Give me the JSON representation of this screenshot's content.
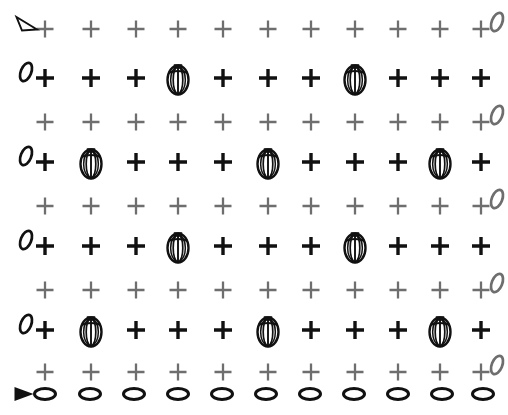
{
  "canvas": {
    "width": 508,
    "height": 415,
    "background": "#ffffff"
  },
  "colors": {
    "black": "#111111",
    "gray": "#6e6e6e"
  },
  "legend": {
    "plus_black_name": "plus-marker-black",
    "plus_gray_name": "plus-marker-gray",
    "melon_name": "melon-lantern-marker",
    "ellipse_name": "flat-ellipse-marker",
    "zero_name": "italic-zero-marker",
    "triangle_hollow_name": "hollow-triangle-marker",
    "triangle_solid_name": "solid-triangle-marker"
  },
  "grid": {
    "columns": 11,
    "rows": 10,
    "col_x": [
      45,
      91,
      136,
      178,
      223,
      268,
      311,
      355,
      398,
      440,
      481
    ],
    "row_y": [
      29,
      78,
      122,
      162,
      206,
      246,
      290,
      330,
      372,
      394
    ],
    "col_x_bottom": [
      45,
      90,
      134,
      178,
      222,
      266,
      310,
      354,
      398,
      442,
      483
    ]
  },
  "rows": [
    {
      "id": "row-1",
      "style": "gray",
      "y": 29,
      "left_marker": "hollow-triangle",
      "right_marker": "zero",
      "cells": [
        "plus",
        "plus",
        "plus",
        "plus",
        "plus",
        "plus",
        "plus",
        "plus",
        "plus",
        "plus",
        "plus"
      ]
    },
    {
      "id": "row-2",
      "style": "black",
      "y": 78,
      "left_marker": "zero",
      "right_marker": "none",
      "cells": [
        "plus",
        "plus",
        "plus",
        "melon",
        "plus",
        "plus",
        "plus",
        "melon",
        "plus",
        "plus",
        "plus"
      ]
    },
    {
      "id": "row-3",
      "style": "gray",
      "y": 122,
      "left_marker": "none",
      "right_marker": "zero",
      "cells": [
        "plus",
        "plus",
        "plus",
        "plus",
        "plus",
        "plus",
        "plus",
        "plus",
        "plus",
        "plus",
        "plus"
      ]
    },
    {
      "id": "row-4",
      "style": "black",
      "y": 162,
      "left_marker": "zero",
      "right_marker": "none",
      "cells": [
        "plus",
        "melon",
        "plus",
        "plus",
        "plus",
        "melon",
        "plus",
        "plus",
        "plus",
        "melon",
        "plus"
      ]
    },
    {
      "id": "row-5",
      "style": "gray",
      "y": 206,
      "left_marker": "none",
      "right_marker": "zero",
      "cells": [
        "plus",
        "plus",
        "plus",
        "plus",
        "plus",
        "plus",
        "plus",
        "plus",
        "plus",
        "plus",
        "plus"
      ]
    },
    {
      "id": "row-6",
      "style": "black",
      "y": 246,
      "left_marker": "zero",
      "right_marker": "none",
      "cells": [
        "plus",
        "plus",
        "plus",
        "melon",
        "plus",
        "plus",
        "plus",
        "melon",
        "plus",
        "plus",
        "plus"
      ]
    },
    {
      "id": "row-7",
      "style": "gray",
      "y": 290,
      "left_marker": "none",
      "right_marker": "zero",
      "cells": [
        "plus",
        "plus",
        "plus",
        "plus",
        "plus",
        "plus",
        "plus",
        "plus",
        "plus",
        "plus",
        "plus"
      ]
    },
    {
      "id": "row-8",
      "style": "black",
      "y": 330,
      "left_marker": "zero",
      "right_marker": "none",
      "cells": [
        "plus",
        "melon",
        "plus",
        "plus",
        "plus",
        "melon",
        "plus",
        "plus",
        "plus",
        "melon",
        "plus"
      ]
    },
    {
      "id": "row-9",
      "style": "gray",
      "y": 372,
      "left_marker": "none",
      "right_marker": "zero",
      "cells": [
        "plus",
        "plus",
        "plus",
        "plus",
        "plus",
        "plus",
        "plus",
        "plus",
        "plus",
        "plus",
        "plus"
      ]
    },
    {
      "id": "row-10",
      "style": "black",
      "y": 394,
      "left_marker": "solid-triangle",
      "right_marker": "none",
      "cells": [
        "ellipse",
        "ellipse",
        "ellipse",
        "ellipse",
        "ellipse",
        "ellipse",
        "ellipse",
        "ellipse",
        "ellipse",
        "ellipse",
        "ellipse"
      ]
    }
  ]
}
